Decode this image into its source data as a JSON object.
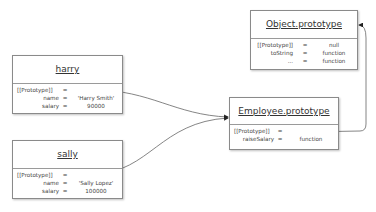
{
  "diagram": {
    "objects": [
      {
        "id": "object-prototype",
        "title": "Object.prototype",
        "props": [
          {
            "key": "[[Prototype]]",
            "eq": "=",
            "value": "null"
          },
          {
            "key": "toString",
            "eq": "=",
            "value": "function"
          },
          {
            "key": "...",
            "eq": "=",
            "value": "function"
          }
        ]
      },
      {
        "id": "harry",
        "title": "harry",
        "props": [
          {
            "key": "[[Prototype]]",
            "eq": "=",
            "value": ""
          },
          {
            "key": "name",
            "eq": "=",
            "value": "'Harry Smith'"
          },
          {
            "key": "salary",
            "eq": "=",
            "value": "90000"
          }
        ]
      },
      {
        "id": "sally",
        "title": "sally",
        "props": [
          {
            "key": "[[Prototype]]",
            "eq": "=",
            "value": ""
          },
          {
            "key": "name",
            "eq": "=",
            "value": "'Sally Lopez'"
          },
          {
            "key": "salary",
            "eq": "=",
            "value": "100000"
          }
        ]
      },
      {
        "id": "employee-prototype",
        "title": "Employee.prototype",
        "props": [
          {
            "key": "[[Prototype]]",
            "eq": "=",
            "value": ""
          },
          {
            "key": "raiseSalary",
            "eq": "=",
            "value": "function"
          }
        ]
      }
    ],
    "edges": [
      {
        "from": "harry.[[Prototype]]",
        "to": "Employee.prototype"
      },
      {
        "from": "sally.[[Prototype]]",
        "to": "Employee.prototype"
      },
      {
        "from": "Employee.prototype.[[Prototype]]",
        "to": "Object.prototype"
      }
    ],
    "colors": {
      "border": "#8a8a8a",
      "line": "#555555",
      "text": "#333333"
    }
  }
}
